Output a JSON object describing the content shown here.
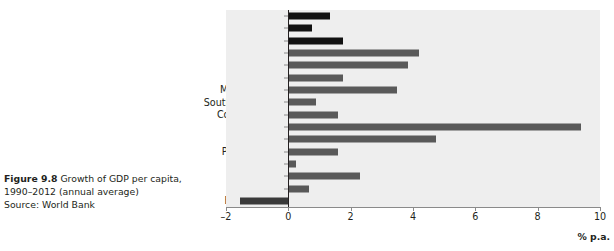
{
  "caption": {
    "figure_label": "Figure 9.8",
    "title": " Growth of GDP per capita, 1990–2012 (annual average)",
    "source": "Source: World Bank"
  },
  "chart_data": {
    "type": "bar",
    "orientation": "horizontal",
    "title": "Growth of GDP per capita, 1990–2012 (annual average)",
    "xlabel": "% p.a.",
    "ylabel": "",
    "xlim": [
      -2,
      10
    ],
    "xticks": [
      -2,
      0,
      2,
      4,
      6,
      8,
      10
    ],
    "xtick_labels": [
      "–2",
      "0",
      "2",
      "4",
      "6",
      "8",
      "10"
    ],
    "grid": false,
    "legend": "none",
    "plot_background": "#eeeeee",
    "zero_line_color": "#231f20",
    "categories": [
      "USA",
      "Japan",
      "UK",
      "Korea",
      "Chile",
      "Brazil",
      "Malaysia",
      "South Africa",
      "Colombia",
      "China",
      "India",
      "Pakistan",
      "Kenya",
      "Nepal",
      "Malawi",
      "Burundi"
    ],
    "values": [
      1.35,
      0.75,
      1.75,
      4.2,
      3.85,
      1.75,
      3.5,
      0.9,
      1.6,
      9.4,
      4.75,
      1.6,
      0.25,
      2.3,
      0.65,
      -1.55
    ],
    "bar_colors": [
      "#111111",
      "#111111",
      "#111111",
      "#595959",
      "#595959",
      "#595959",
      "#595959",
      "#595959",
      "#595959",
      "#595959",
      "#595959",
      "#595959",
      "#595959",
      "#595959",
      "#595959",
      "#3a3a3a"
    ]
  }
}
